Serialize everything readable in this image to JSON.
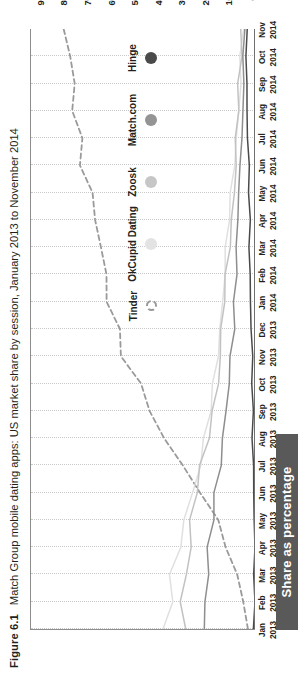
{
  "figure": {
    "number": "Figure 6.1",
    "caption": "Match Group mobile dating apps: US market share by session, January 2013 to November 2014"
  },
  "axis": {
    "y_title": "Share as percentage",
    "y_ticks": [
      "0%",
      "10%",
      "20%",
      "30%",
      "40%",
      "50%",
      "60%",
      "70%",
      "80%",
      "90%"
    ]
  },
  "legend": {
    "items": [
      {
        "label": "Tinder",
        "color": "#9a9a9a",
        "marker": "hollow-dashed-circle"
      },
      {
        "label": "OkCupid Dating",
        "color": "#e3e3e3",
        "marker": "filled-circle"
      },
      {
        "label": "Zoosk",
        "color": "#c6c6c6",
        "marker": "filled-circle"
      },
      {
        "label": "Match.com",
        "color": "#949494",
        "marker": "filled-circle"
      },
      {
        "label": "Hinge",
        "color": "#4a4a4a",
        "marker": "filled-circle"
      }
    ]
  },
  "chart_data": {
    "type": "line",
    "title": "Match Group mobile dating apps: US market share by session, January 2013 to November 2014",
    "xlabel": "",
    "ylabel": "Share as percentage",
    "ylim": [
      0,
      95
    ],
    "grid": "vertical-dotted",
    "legend_position": "inside-top-center",
    "categories": [
      "Jan 2013",
      "Feb 2013",
      "Mar 2013",
      "Apr 2013",
      "May 2013",
      "Jun 2013",
      "Jul 2013",
      "Aug 2013",
      "Sep 2013",
      "Oct 2013",
      "Nov 2013",
      "Dec 2013",
      "Jan 2014",
      "Feb 2014",
      "Mar 2014",
      "Apr 2014",
      "May 2014",
      "Jun 2014",
      "Jul 2014",
      "Aug 2014",
      "Sep 2014",
      "Oct 2014",
      "Nov 2014"
    ],
    "x_tick_labels": [
      [
        "Jan",
        "2013"
      ],
      [
        "Feb",
        "2013"
      ],
      [
        "Mar",
        "2013"
      ],
      [
        "Apr",
        "2013"
      ],
      [
        "May",
        "2013"
      ],
      [
        "Jun",
        "2013"
      ],
      [
        "Jul",
        "2013"
      ],
      [
        "Aug",
        "2013"
      ],
      [
        "Sep",
        "2013"
      ],
      [
        "Oct",
        "2013"
      ],
      [
        "Nov",
        "2013"
      ],
      [
        "Dec",
        "2013"
      ],
      [
        "Jan",
        "2014"
      ],
      [
        "Feb",
        "2014"
      ],
      [
        "Mar",
        "2014"
      ],
      [
        "Apr",
        "2014"
      ],
      [
        "May",
        "2014"
      ],
      [
        "Jun",
        "2014"
      ],
      [
        "Jul",
        "2014"
      ],
      [
        "Aug",
        "2014"
      ],
      [
        "Sep",
        "2014"
      ],
      [
        "Oct",
        "2014"
      ],
      [
        "Nov",
        "2014"
      ]
    ],
    "series": [
      {
        "name": "Tinder",
        "color": "#9a9a9a",
        "style": "dashed",
        "values": [
          3,
          5,
          8,
          12,
          16,
          22,
          31,
          39,
          45,
          50,
          55,
          58,
          61,
          64,
          66,
          68,
          70,
          72,
          74,
          76,
          78,
          79,
          81
        ]
      },
      {
        "name": "OkCupid Dating",
        "color": "#e0e0e0",
        "style": "solid",
        "values": [
          38,
          36,
          34,
          32,
          30,
          27,
          24,
          21,
          19,
          17,
          16,
          15,
          14,
          13,
          12,
          11,
          10,
          9,
          8,
          7,
          6,
          6,
          5
        ]
      },
      {
        "name": "Zoosk",
        "color": "#c2c2c2",
        "style": "solid",
        "values": [
          30,
          31,
          30,
          28,
          27,
          25,
          22,
          20,
          18,
          16,
          15,
          14,
          13,
          12,
          11,
          10,
          9,
          8,
          8,
          7,
          7,
          6,
          6
        ]
      },
      {
        "name": "Match.com",
        "color": "#8e8e8e",
        "style": "solid",
        "values": [
          22,
          21,
          20,
          19,
          18,
          17,
          15,
          14,
          12,
          11,
          10,
          9,
          9,
          8,
          8,
          7,
          7,
          6,
          6,
          5,
          5,
          5,
          4
        ]
      },
      {
        "name": "Hinge",
        "color": "#4a4a4a",
        "style": "solid",
        "values": [
          0.2,
          0.2,
          0.3,
          0.3,
          0.4,
          0.5,
          0.6,
          0.8,
          1.0,
          1.2,
          1.4,
          1.6,
          1.8,
          2.0,
          2.2,
          2.4,
          2.6,
          2.8,
          3.0,
          3.2,
          3.4,
          3.6,
          3.8
        ]
      }
    ]
  }
}
